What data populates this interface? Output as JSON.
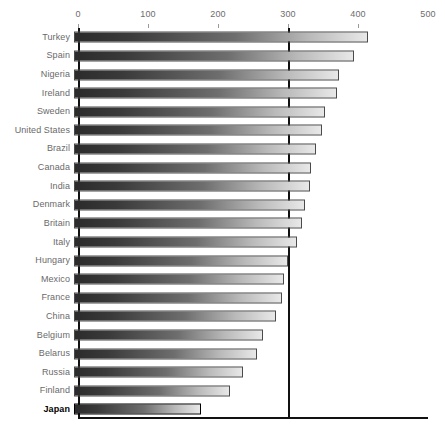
{
  "chart_data": {
    "type": "bar",
    "orientation": "horizontal",
    "title": "",
    "subtitle": "",
    "xlabel": "",
    "ylabel": "",
    "xlim": [
      0,
      500
    ],
    "ylim": null,
    "grid": false,
    "legend": null,
    "legend_position": "none",
    "x_ticks": [
      0,
      100,
      200,
      300,
      400,
      500
    ],
    "x_tick_labels": [
      "0",
      "100",
      "200",
      "300",
      "400",
      "500"
    ],
    "reference_line": {
      "value": 300,
      "orientation": "vertical",
      "color": "#111111"
    },
    "highlight_category": "Japan",
    "bar_color_start": "#2b2b2b",
    "bar_color_end": "#e8e8e8",
    "bar_border_color": "#4a4a4a",
    "axis_color": "#111111",
    "label_color": "#6a6a6a",
    "categories": [
      "Turkey",
      "Spain",
      "Nigeria",
      "Ireland",
      "Sweden",
      "United States",
      "Brazil",
      "Canada",
      "India",
      "Denmark",
      "Britain",
      "Italy",
      "Hungary",
      "Mexico",
      "France",
      "China",
      "Belgium",
      "Belarus",
      "Russia",
      "Finland",
      "Japan"
    ],
    "values": [
      420,
      400,
      378,
      375,
      359,
      354,
      345,
      339,
      337,
      330,
      325,
      318,
      305,
      300,
      297,
      288,
      270,
      262,
      242,
      223,
      181
    ]
  }
}
